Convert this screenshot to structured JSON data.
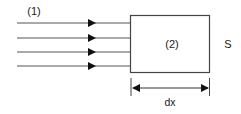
{
  "figure": {
    "background_color": "#ffffff",
    "stroke_color": "#333333",
    "text_color": "#1a1a1a",
    "labels": {
      "region_one": "(1)",
      "region_two": "(2)",
      "area": "S",
      "thickness": "dx"
    },
    "rays": {
      "count": 4,
      "direction": "left-to-right",
      "arrowhead": "filled-triangle",
      "y_positions": [
        23,
        38,
        52,
        66
      ],
      "x_start": 17,
      "x_arrow_tip": 96,
      "x_end": 130
    },
    "slab": {
      "x": 130,
      "y": 15,
      "width": 80,
      "height": 58,
      "fill": "none"
    },
    "dimension": {
      "label": "dx",
      "y": 88,
      "x_start": 131,
      "x_end": 210,
      "extension_top": 78,
      "extension_bottom": 96,
      "arrowheads": "both"
    }
  }
}
